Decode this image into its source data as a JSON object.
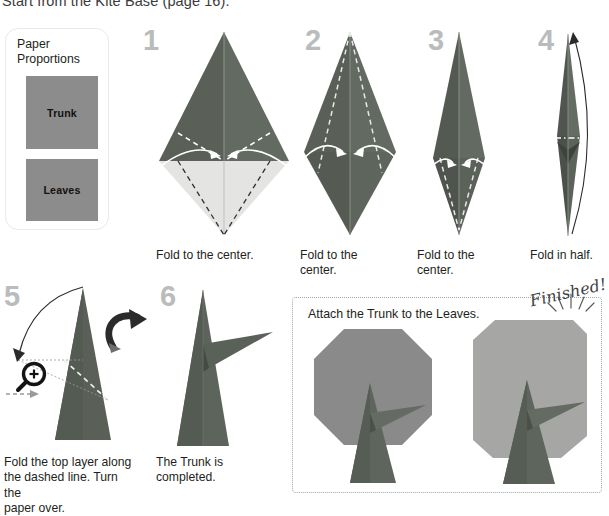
{
  "intro": {
    "text": "Start from the Kite Base (page 16)."
  },
  "paper_proportions": {
    "title": "Paper\nProportions",
    "title_line1": "Paper",
    "title_line2": "Proportions",
    "squares": [
      {
        "label": "Trunk"
      },
      {
        "label": "Leaves"
      }
    ]
  },
  "steps": [
    {
      "number": "1",
      "caption": "Fold to the center."
    },
    {
      "number": "2",
      "caption": "Fold to the\ncenter.",
      "caption_line1": "Fold to the",
      "caption_line2": "center."
    },
    {
      "number": "3",
      "caption": "Fold to the\ncenter.",
      "caption_line1": "Fold to the",
      "caption_line2": "center."
    },
    {
      "number": "4",
      "caption": "Fold in half."
    },
    {
      "number": "5",
      "caption": "Fold the top layer along the dashed line. Turn the paper over.",
      "caption_line1": "Fold the top layer along",
      "caption_line2": "the dashed line. Turn the",
      "caption_line3": "paper over."
    },
    {
      "number": "6",
      "caption": "The Trunk is completed.",
      "caption_line1": "The Trunk is",
      "caption_line2": "completed."
    }
  ],
  "finished_panel": {
    "caption": "Attach the Trunk to the Leaves.",
    "badge": "Finished!"
  },
  "icons": {
    "magnifier": "magnifier-plus-icon",
    "turn_over": "turn-over-arrow-icon",
    "fold_arrow": "fold-arrow-icon",
    "starburst": "starburst-icon"
  },
  "colors": {
    "paper_dark": "#5a6058",
    "paper_mid": "#6f756d",
    "paper_light": "#e4e4e2",
    "leaves": "#8a8a8a",
    "leaves_light": "#a6a6a4",
    "trunk_dark": "#585e57",
    "step_number": "#b9bcbc",
    "text": "#231f20",
    "panel_border": "#9aa7a0",
    "card_border": "#e9e9e9"
  }
}
